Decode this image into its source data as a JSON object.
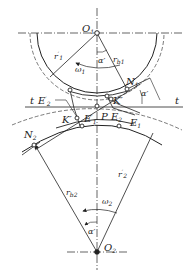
{
  "diagram": {
    "type": "gear-meshing",
    "colors": {
      "stroke": "#222222",
      "background": "#ffffff"
    },
    "labels": {
      "O1": {
        "base": "O",
        "sub": "1"
      },
      "O2": {
        "base": "O",
        "sub": "2"
      },
      "r1_prime": {
        "base": "r",
        "sup": "′",
        "sub": "1"
      },
      "rb1": {
        "base": "r",
        "sub": "b1"
      },
      "omega1": {
        "base": "ω",
        "sub": "1"
      },
      "alpha_top": "α′",
      "N1": {
        "base": "N",
        "sub": "1"
      },
      "alpha_right": "α′",
      "K_right": "K′",
      "t_left": "t",
      "t_right": "t",
      "E2_prime": {
        "base": "E",
        "sup": "′",
        "sub": "2"
      },
      "K_left": "K′",
      "E1_prime": {
        "base": "E",
        "sup": "′",
        "sub": "1"
      },
      "P": "P",
      "E2": {
        "base": "E",
        "sub": "2"
      },
      "E1": {
        "base": "E",
        "sub": "1"
      },
      "N2": {
        "base": "N",
        "sub": "2"
      },
      "rb2": {
        "base": "r",
        "sub": "b2"
      },
      "r2_prime": {
        "base": "r",
        "sup": "′",
        "sub": "2"
      },
      "omega2": {
        "base": "ω",
        "sub": "2"
      },
      "alpha_bottom": "α′"
    }
  }
}
